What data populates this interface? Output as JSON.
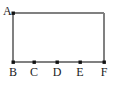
{
  "figure": {
    "canvas": {
      "width": 114,
      "height": 90,
      "background": "#ffffff"
    },
    "style": {
      "line_color": "#808080",
      "line_width": 1.5,
      "point_color": "#111111",
      "point_size": 3,
      "label_color": "#1a1a1a",
      "label_font_size": 12
    },
    "rectangle": {
      "left": 13,
      "top": 13,
      "right": 104,
      "bottom": 62
    },
    "points": [
      {
        "name": "A",
        "label": "A",
        "x": 13,
        "y": 13,
        "label_x": 5,
        "label_y": 6,
        "label_position": "upper-left"
      },
      {
        "name": "B",
        "label": "B",
        "x": 13,
        "y": 62,
        "label_x": 13,
        "label_y": 67,
        "label_position": "below"
      },
      {
        "name": "C",
        "label": "C",
        "x": 34,
        "y": 62,
        "label_x": 34,
        "label_y": 67,
        "label_position": "below"
      },
      {
        "name": "D",
        "label": "D",
        "x": 57,
        "y": 62,
        "label_x": 57,
        "label_y": 67,
        "label_position": "below"
      },
      {
        "name": "E",
        "label": "E",
        "x": 80,
        "y": 62,
        "label_x": 80,
        "label_y": 67,
        "label_position": "below"
      },
      {
        "name": "F",
        "label": "F",
        "x": 104,
        "y": 62,
        "label_x": 104,
        "label_y": 67,
        "label_position": "below"
      }
    ],
    "segments": [
      {
        "name": "top-edge",
        "x1": 13,
        "y1": 13,
        "x2": 104,
        "y2": 13
      },
      {
        "name": "left-edge",
        "x1": 13,
        "y1": 13,
        "x2": 13,
        "y2": 62
      },
      {
        "name": "right-edge",
        "x1": 104,
        "y1": 13,
        "x2": 104,
        "y2": 62
      },
      {
        "name": "bottom-edge",
        "x1": 13,
        "y1": 62,
        "x2": 104,
        "y2": 62
      }
    ]
  }
}
